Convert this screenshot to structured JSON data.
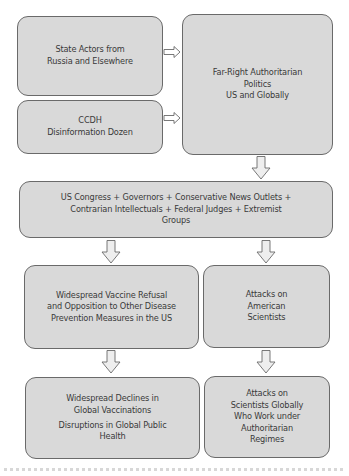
{
  "diagram": {
    "type": "flowchart",
    "box_fill": "#d9d9d9",
    "border_color": "#6a6a6a",
    "text_color": "#3a3a3a",
    "nodes": {
      "state_actors": {
        "lines": [
          "State Actors from",
          "Russia and Elsewhere"
        ]
      },
      "ccdh": {
        "lines": [
          "CCDH",
          "Disinformation Dozen"
        ]
      },
      "far_right": {
        "lines": [
          "Far-Right Authoritarian",
          "Politics",
          "US and Globally"
        ]
      },
      "us_actors": {
        "lines": [
          "US Congress + Governors + Conservative News Outlets +",
          "Contrarian Intellectuals + Federal Judges + Extremist",
          "Groups"
        ]
      },
      "vaccine_refusal": {
        "lines": [
          "Widespread Vaccine Refusal",
          "and Opposition to Other Disease",
          "Prevention Measures in the US"
        ]
      },
      "attacks_american": {
        "lines": [
          "Attacks on",
          "American",
          "Scientists"
        ]
      },
      "global_declines": {
        "lines": [
          "Widespread Declines in",
          "Global Vaccinations"
        ],
        "lines2": [
          "Disruptions in Global Public",
          "Health"
        ]
      },
      "attacks_global": {
        "lines": [
          "Attacks on",
          "Scientists Globally",
          "Who Work under",
          "Authoritarian",
          "Regimes"
        ]
      }
    },
    "edges": [
      {
        "from": "state_actors",
        "to": "far_right"
      },
      {
        "from": "ccdh",
        "to": "far_right"
      },
      {
        "from": "far_right",
        "to": "us_actors"
      },
      {
        "from": "us_actors",
        "to": "vaccine_refusal"
      },
      {
        "from": "us_actors",
        "to": "attacks_american"
      },
      {
        "from": "vaccine_refusal",
        "to": "global_declines"
      },
      {
        "from": "attacks_american",
        "to": "attacks_global"
      }
    ]
  }
}
